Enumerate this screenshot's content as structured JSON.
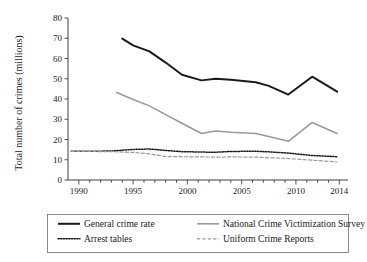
{
  "chart_data": {
    "type": "line",
    "title": "",
    "xlabel": "",
    "ylabel": "Total number of crimes (millions)",
    "xlim": [
      1989,
      2014.8
    ],
    "ylim": [
      0,
      80
    ],
    "yticks": [
      0,
      10,
      20,
      30,
      40,
      50,
      60,
      70,
      80
    ],
    "ytick_labels": [
      "0",
      "10",
      "20",
      "30",
      "40",
      "50",
      "60",
      "70",
      "80"
    ],
    "xticks": [
      1990,
      1995,
      2000,
      2005,
      2010,
      2014
    ],
    "xtick_labels": [
      "1990",
      "1995",
      "2000",
      "2005",
      "2010",
      "2014"
    ],
    "minor_xtick_step": 1,
    "grid": false,
    "legend_position": "below-axes",
    "legend_columns": 2,
    "series": [
      {
        "name": "General crime rate",
        "color": "#1a1a1a",
        "style": "solid",
        "width": 2.0,
        "x": [
          1994.0,
          1995.0,
          1996.5,
          1998.0,
          1999.5,
          2001.3,
          2002.6,
          2004.0,
          2006.3,
          2007.5,
          2009.3,
          2011.5,
          2013.8
        ],
        "y": [
          69.8,
          66.5,
          63.5,
          58.0,
          52.0,
          49.2,
          50.0,
          49.5,
          48.3,
          46.5,
          42.2,
          51.0,
          43.6
        ]
      },
      {
        "name": "National Crime Victimization Survey",
        "color": "#9a9a9a",
        "style": "solid",
        "width": 1.6,
        "x": [
          1993.5,
          1995.0,
          1996.5,
          1998.0,
          1999.5,
          2001.3,
          2002.6,
          2004.0,
          2006.3,
          2007.5,
          2009.3,
          2011.5,
          2013.8
        ],
        "y": [
          43.2,
          39.8,
          36.6,
          32.3,
          28.0,
          23.0,
          24.2,
          23.6,
          23.0,
          21.5,
          19.1,
          28.4,
          23.0
        ]
      },
      {
        "name": "Arrest tables",
        "color": "#1a1a1a",
        "style": "dotted",
        "width": 1.5,
        "x": [
          1989.3,
          1991.0,
          1993.0,
          1995.0,
          1996.5,
          1998.0,
          1999.5,
          2001.3,
          2002.6,
          2004.0,
          2006.3,
          2007.5,
          2009.3,
          2011.5,
          2013.8
        ],
        "y": [
          14.2,
          14.2,
          14.3,
          15.1,
          15.3,
          14.6,
          14.0,
          13.8,
          13.7,
          14.1,
          14.2,
          13.9,
          13.3,
          12.1,
          11.5
        ]
      },
      {
        "name": "Uniform Crime Reports",
        "color": "#9a9a9a",
        "style": "dashed",
        "width": 1.2,
        "x": [
          1989.3,
          1991.0,
          1993.0,
          1995.0,
          1996.5,
          1998.0,
          1999.5,
          2001.3,
          2002.6,
          2004.0,
          2006.3,
          2007.5,
          2009.3,
          2011.5,
          2013.8
        ],
        "y": [
          14.1,
          14.1,
          14.0,
          13.6,
          12.9,
          11.6,
          11.5,
          11.4,
          11.3,
          11.4,
          11.3,
          11.0,
          10.6,
          9.8,
          8.9
        ]
      }
    ],
    "legend_entries": [
      {
        "label": "General crime rate",
        "color": "#1a1a1a",
        "style": "solid"
      },
      {
        "label": "National Crime Victimization Survey",
        "color": "#9a9a9a",
        "style": "solid"
      },
      {
        "label": "Arrest tables",
        "color": "#1a1a1a",
        "style": "dotted"
      },
      {
        "label": "Uniform Crime Reports",
        "color": "#9a9a9a",
        "style": "dashed"
      }
    ]
  }
}
